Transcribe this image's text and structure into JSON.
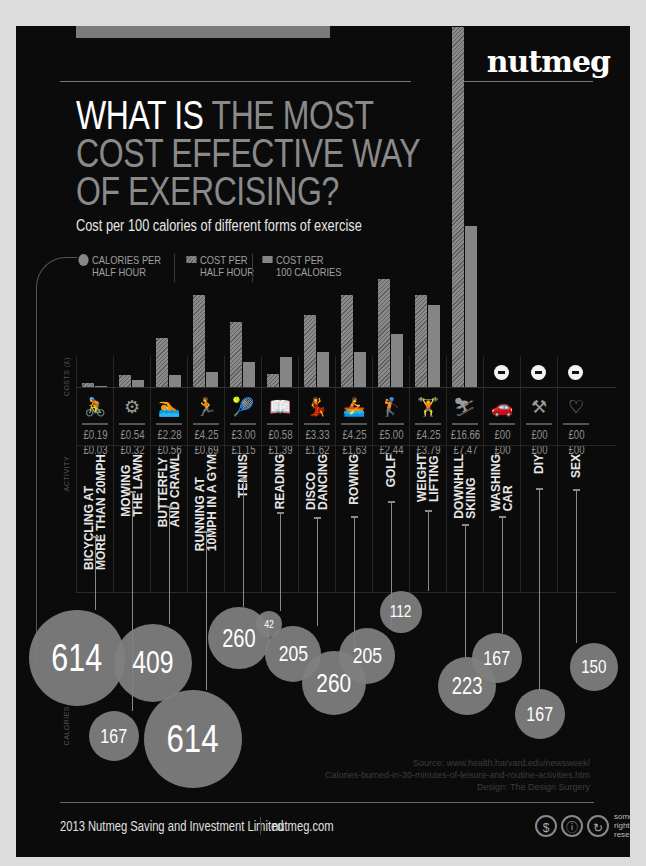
{
  "header": {
    "logo": "nutmeg",
    "title_white": "WHAT IS ",
    "title_grey_1": "THE MOST",
    "title_grey_2": "COST EFFECTIVE WAY",
    "title_grey_3": "OF EXERCISING?",
    "subtitle": "Cost per 100 calories of different forms of exercise"
  },
  "legend": {
    "calories_1": "CALORIES PER",
    "calories_2": "HALF HOUR",
    "cost_half_1": "COST PER",
    "cost_half_2": "HALF HOUR",
    "cost_100_1": "COST PER",
    "cost_100_2": "100 CALORIES"
  },
  "axes": {
    "costs": "COSTS (£)",
    "activity": "ACTIVITY",
    "calories": "CALORIES"
  },
  "activities": [
    {
      "name_1": "BICYCLING AT",
      "name_2": "MORE THAN 20MPH",
      "icon": "cycling-icon",
      "glyph": "🚴",
      "cost_half_hour": "£0.19",
      "cost_100_cal": "£0.03",
      "calories": "614"
    },
    {
      "name_1": "MOWING",
      "name_2": "THE LAWN",
      "icon": "lawnmower-icon",
      "glyph": "⚙",
      "cost_half_hour": "£0.54",
      "cost_100_cal": "£0.32",
      "calories": "167"
    },
    {
      "name_1": "BUTTERFLY",
      "name_2": "AND CRAWL",
      "icon": "swimming-icon",
      "glyph": "🏊",
      "cost_half_hour": "£2.28",
      "cost_100_cal": "£0.56",
      "calories": "409"
    },
    {
      "name_1": "RUNNING AT",
      "name_2": "10MPH IN A GYM",
      "icon": "running-icon",
      "glyph": "🏃",
      "cost_half_hour": "£4.25",
      "cost_100_cal": "£0.69",
      "calories": "614"
    },
    {
      "name_1": "TENNIS",
      "name_2": "",
      "icon": "tennis-icon",
      "glyph": "🎾",
      "cost_half_hour": "£3.00",
      "cost_100_cal": "£1.15",
      "calories": "260"
    },
    {
      "name_1": "READING",
      "name_2": "",
      "icon": "reading-icon",
      "glyph": "📖",
      "cost_half_hour": "£0.58",
      "cost_100_cal": "£1.39",
      "calories": "42"
    },
    {
      "name_1": "DISCO",
      "name_2": "DANCING",
      "icon": "dancing-icon",
      "glyph": "💃",
      "cost_half_hour": "£3.33",
      "cost_100_cal": "£1.62",
      "calories": "205"
    },
    {
      "name_1": "ROWING",
      "name_2": "",
      "icon": "rowing-icon",
      "glyph": "🚣",
      "cost_half_hour": "£4.25",
      "cost_100_cal": "£1.63",
      "calories": "260"
    },
    {
      "name_1": "GOLF",
      "name_2": "",
      "icon": "golf-icon",
      "glyph": "🏌",
      "cost_half_hour": "£5.00",
      "cost_100_cal": "£2.44",
      "calories": "205"
    },
    {
      "name_1": "WEIGHT",
      "name_2": "LIFTING",
      "icon": "weightlifting-icon",
      "glyph": "🏋",
      "cost_half_hour": "£4.25",
      "cost_100_cal": "£3.79",
      "calories": "112"
    },
    {
      "name_1": "DOWNHILL",
      "name_2": "SKIING",
      "icon": "skiing-icon",
      "glyph": "⛷",
      "cost_half_hour": "£16.66",
      "cost_100_cal": "£7.47",
      "calories": "223"
    },
    {
      "name_1": "WASHING",
      "name_2": "CAR",
      "icon": "car-icon",
      "glyph": "🚗",
      "cost_half_hour": "£00",
      "cost_100_cal": "£00",
      "calories": "167"
    },
    {
      "name_1": "DIY",
      "name_2": "",
      "icon": "tools-icon",
      "glyph": "⚒",
      "cost_half_hour": "£00",
      "cost_100_cal": "£00",
      "calories": "167"
    },
    {
      "name_1": "SEX",
      "name_2": "",
      "icon": "heart-icon",
      "glyph": "♡",
      "cost_half_hour": "£00",
      "cost_100_cal": "£00",
      "calories": "150"
    }
  ],
  "footer": {
    "source_1": "Source: www.health.harvard.edu/newsweek/",
    "source_2": "Calories-burned-in-30-minutes-of-leisure-and-routine-activities.htm",
    "source_3": "Design: The Design Surgery",
    "company": "2013 Nutmeg Saving and Investment Limited",
    "website": "nutmeg.com",
    "rights_1": "some",
    "rights_2": "rights",
    "rights_3": "reserved"
  },
  "chart_data": {
    "type": "bar",
    "title": "What is the most cost effective way of exercising?",
    "subtitle": "Cost per 100 calories of different forms of exercise",
    "ylabel": "COSTS (£)",
    "xlabel": "ACTIVITY",
    "categories": [
      "Bicycling at more than 20mph",
      "Mowing the lawn",
      "Butterfly and crawl",
      "Running at 10mph in a gym",
      "Tennis",
      "Reading",
      "Disco dancing",
      "Rowing",
      "Golf",
      "Weight lifting",
      "Downhill skiing",
      "Washing car",
      "DIY",
      "Sex"
    ],
    "series": [
      {
        "name": "Cost per half hour (£)",
        "values": [
          0.19,
          0.54,
          2.28,
          4.25,
          3.0,
          0.58,
          3.33,
          4.25,
          5.0,
          4.25,
          16.66,
          0,
          0,
          0
        ]
      },
      {
        "name": "Cost per 100 calories (£)",
        "values": [
          0.03,
          0.32,
          0.56,
          0.69,
          1.15,
          1.39,
          1.62,
          1.63,
          2.44,
          3.79,
          7.47,
          0,
          0,
          0
        ]
      },
      {
        "name": "Calories per half hour",
        "values": [
          614,
          167,
          409,
          614,
          260,
          42,
          205,
          260,
          205,
          112,
          223,
          167,
          167,
          150
        ]
      }
    ],
    "legend": [
      "Calories per half hour",
      "Cost per half hour",
      "Cost per 100 calories"
    ],
    "legend_position": "top-left",
    "grid": false
  }
}
